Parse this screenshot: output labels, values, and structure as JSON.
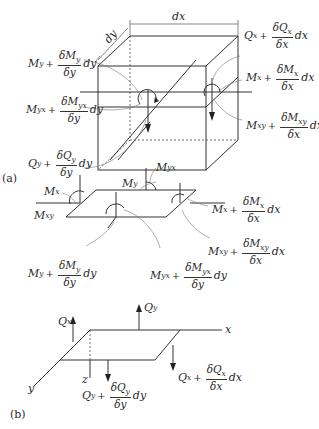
{
  "figure": {
    "panels": [
      {
        "id": "a",
        "tag": "(a)",
        "description": "Plate element cube with moments and shears on faces",
        "dimension_labels": {
          "dx": "dx",
          "dy": "dy"
        },
        "labels": {
          "my_left": {
            "base": "M",
            "sub": "y",
            "num": "δM",
            "num_sub": "y",
            "den": "δy",
            "tail": "dy"
          },
          "myx_left": {
            "base": "M",
            "sub": "yx",
            "num": "δM",
            "num_sub": "yx",
            "den": "δy",
            "tail": "dy"
          },
          "qy_left": {
            "base": "Q",
            "sub": "y",
            "num": "δQ",
            "num_sub": "y",
            "den": "δy",
            "tail": "dy"
          },
          "qx_right": {
            "base": "Q",
            "sub": "x",
            "num": "δQ",
            "num_sub": "x",
            "den": "δx",
            "tail": "dx"
          },
          "mx_right": {
            "base": "M",
            "sub": "x",
            "num": "δM",
            "num_sub": "x",
            "den": "δx",
            "tail": "dx"
          },
          "mxy_right": {
            "base": "M",
            "sub": "xy",
            "num": "δM",
            "num_sub": "xy",
            "den": "δx",
            "tail": "dx"
          }
        }
      },
      {
        "id": "b1",
        "tag": "",
        "description": "Plate mid-surface with moments",
        "labels": {
          "mx": {
            "base": "M",
            "sub": "x"
          },
          "my": {
            "base": "M",
            "sub": "y"
          },
          "myx": {
            "base": "M",
            "sub": "yx"
          },
          "mxy": {
            "base": "M",
            "sub": "xy"
          },
          "mx_plus": {
            "base": "M",
            "sub": "x",
            "num": "δM",
            "num_sub": "x",
            "den": "δx",
            "tail": "dx"
          },
          "mxy_plus": {
            "base": "M",
            "sub": "xy",
            "num": "δM",
            "num_sub": "xy",
            "den": "δx",
            "tail": "dx"
          },
          "my_plus": {
            "base": "M",
            "sub": "y",
            "num": "δM",
            "num_sub": "y",
            "den": "δy",
            "tail": "dy"
          },
          "myx_plus": {
            "base": "M",
            "sub": "yx",
            "num": "δM",
            "num_sub": "yx",
            "den": "δy",
            "tail": "dy"
          }
        }
      },
      {
        "id": "b",
        "tag": "(b)",
        "description": "Plate mid-surface with shear forces and axes",
        "axes": {
          "x": "x",
          "y": "y",
          "z": "z"
        },
        "labels": {
          "qx": {
            "base": "Q",
            "sub": "x"
          },
          "qy": {
            "base": "Q",
            "sub": "y"
          },
          "qy_plus": {
            "base": "Q",
            "sub": "y",
            "num": "δQ",
            "num_sub": "y",
            "den": "δy",
            "tail": "dy"
          },
          "qx_plus": {
            "base": "Q",
            "sub": "x",
            "num": "δQ",
            "num_sub": "x",
            "den": "δx",
            "tail": "dx"
          }
        }
      }
    ]
  }
}
